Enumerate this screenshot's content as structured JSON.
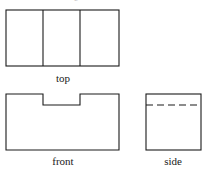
{
  "figure": {
    "kind": "orthographic-projection-drawing",
    "background_color": "#ffffff",
    "line_color": "#1a1a1a",
    "partial_text_above": "e"
  },
  "views": {
    "top": {
      "label": "top",
      "shape": "rectangle divided into three vertical panels",
      "outline": {
        "x": 6,
        "y": 10,
        "width": 113,
        "height": 56
      },
      "divider_lines_x": [
        43,
        80
      ],
      "line_style": "solid"
    },
    "front": {
      "label": "front",
      "shape": "rectangle with rectangular notch cut from top center",
      "outline": {
        "x": 6,
        "y": 94,
        "width": 113,
        "height": 56
      },
      "notch": {
        "left_x": 43,
        "right_x": 80,
        "bottom_y": 105,
        "top_y": 94
      },
      "line_style": "solid"
    },
    "side": {
      "label": "side",
      "shape": "rectangle with horizontal hidden line",
      "outline": {
        "x": 146,
        "y": 94,
        "width": 55,
        "height": 56
      },
      "hidden_line": {
        "y": 105,
        "from_x": 146,
        "to_x": 201
      },
      "line_style": "solid outline with dashed hidden line"
    }
  }
}
